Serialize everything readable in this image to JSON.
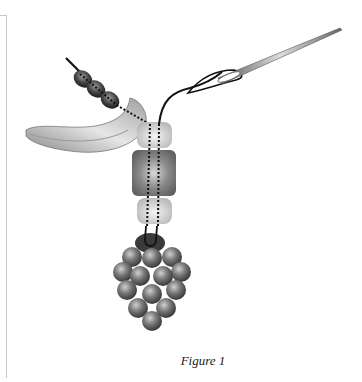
{
  "figure": {
    "caption": "Figure 1",
    "components": [
      {
        "name": "seed-beads",
        "count": 3,
        "color": "#4a4a4a"
      },
      {
        "name": "crescent-bead",
        "color": "#b0b0b0"
      },
      {
        "name": "top-light-bead",
        "color": "#d8d8d8"
      },
      {
        "name": "center-dark-bead",
        "color": "#808080"
      },
      {
        "name": "bottom-light-bead",
        "color": "#d8d8d8"
      },
      {
        "name": "berry-cluster",
        "color": "#6a6a6a"
      },
      {
        "name": "needle",
        "color": "#888888"
      }
    ]
  },
  "colors": {
    "background": "#ffffff",
    "frame": "#c8c8c8",
    "thread": "#111111"
  }
}
